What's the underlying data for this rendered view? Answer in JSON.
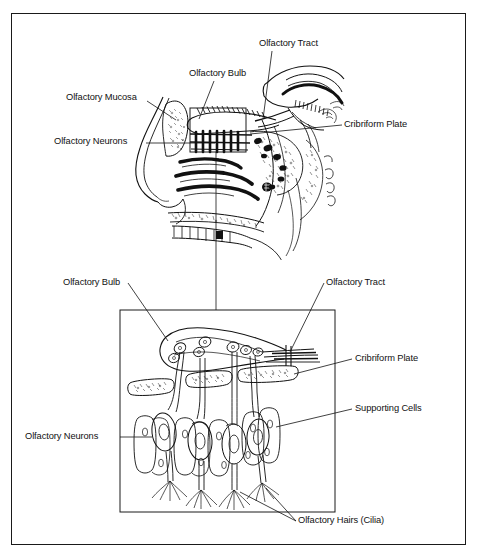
{
  "figure": {
    "background_color": "#ffffff",
    "ink_color": "#111111",
    "frame_color": "#1a1a1a"
  },
  "panels": {
    "upper": {
      "name": "Sagittal section of head showing nasal cavity and olfactory region",
      "inset_box_caption": "olfactory epithelium detail region"
    },
    "lower": {
      "name": "Magnified detail of olfactory epithelium and olfactory bulb"
    }
  },
  "labels": {
    "upper": [
      {
        "id": "olfactory-tract",
        "text": "Olfactory Tract"
      },
      {
        "id": "olfactory-bulb",
        "text": "Olfactory Bulb"
      },
      {
        "id": "olfactory-mucosa",
        "text": "Olfactory Mucosa"
      },
      {
        "id": "olfactory-neurons",
        "text": "Olfactory Neurons"
      },
      {
        "id": "cribriform-plate",
        "text": "Cribriform Plate"
      }
    ],
    "lower": [
      {
        "id": "olfactory-bulb",
        "text": "Olfactory Bulb"
      },
      {
        "id": "olfactory-tract",
        "text": "Olfactory Tract"
      },
      {
        "id": "cribriform-plate",
        "text": "Cribriform Plate"
      },
      {
        "id": "supporting-cells",
        "text": "Supporting Cells"
      },
      {
        "id": "olfactory-neurons",
        "text": "Olfactory Neurons"
      },
      {
        "id": "olfactory-hairs",
        "text": "Olfactory Hairs (Cilia)"
      }
    ]
  }
}
